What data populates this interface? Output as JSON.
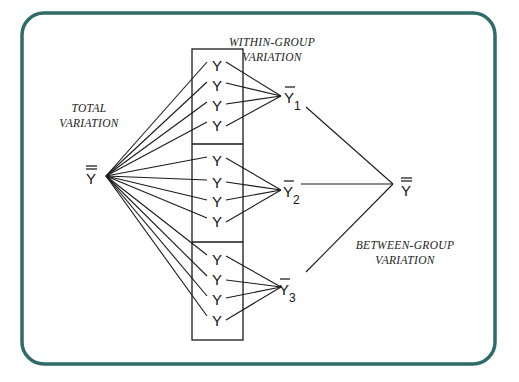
{
  "diagram": {
    "frame_color": "#2f6b68",
    "labels": {
      "total": [
        "TOTAL",
        "VARIATION"
      ],
      "within": [
        "WITHIN-GROUP",
        "VARIATION"
      ],
      "between": [
        "BETWEEN-GROUP",
        "VARIATION"
      ]
    },
    "observation_symbol": "Y",
    "grand_mean_symbol": "Y",
    "group_mean_symbol": "Y",
    "groups": [
      {
        "subscript": "1",
        "observations": [
          "Y",
          "Y",
          "Y",
          "Y"
        ]
      },
      {
        "subscript": "2",
        "observations": [
          "Y",
          "Y",
          "Y",
          "Y"
        ]
      },
      {
        "subscript": "3",
        "observations": [
          "Y",
          "Y",
          "Y",
          "Y"
        ]
      }
    ]
  }
}
